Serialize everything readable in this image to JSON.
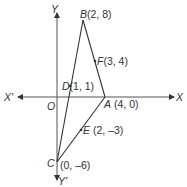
{
  "diagram": {
    "type": "coordinate-geometry-triangle",
    "axes": {
      "x_positive_label": "X",
      "x_negative_label": "X'",
      "y_positive_label": "Y",
      "y_negative_label": "Y'",
      "origin_label": "O"
    },
    "points": [
      {
        "name": "A",
        "coords": "(4, 0)",
        "x": 4,
        "y": 0
      },
      {
        "name": "B",
        "coords": "(2, 8)",
        "x": 2,
        "y": 8
      },
      {
        "name": "C",
        "coords": "(0, –6)",
        "x": 0,
        "y": -6
      },
      {
        "name": "D",
        "coords": "(1, 1)",
        "x": 1,
        "y": 1
      },
      {
        "name": "E",
        "coords": "(2, –3)",
        "x": 2,
        "y": -3
      },
      {
        "name": "F",
        "coords": "(3, 4)",
        "x": 3,
        "y": 4
      }
    ],
    "segments": [
      "AB",
      "BC",
      "CA"
    ],
    "colors": {
      "line": "#333333",
      "background": "#ffffff"
    }
  }
}
